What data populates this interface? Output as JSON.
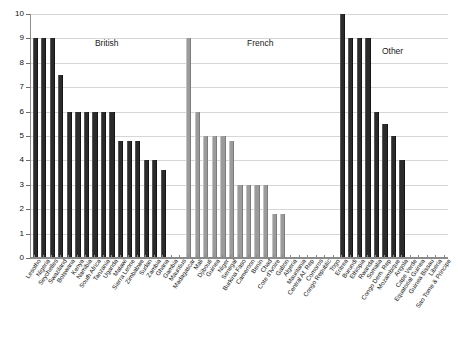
{
  "chart_data": {
    "type": "bar",
    "title": "",
    "subtitle": "",
    "xlabel": "",
    "ylabel": "",
    "ylim": [
      0,
      10
    ],
    "y_ticks": [
      0,
      1,
      2,
      3,
      4,
      5,
      6,
      7,
      8,
      9,
      10
    ],
    "grid": true,
    "legend": "none",
    "group_labels": [
      "British",
      "French",
      "Other"
    ],
    "groups": [
      {
        "name": "British",
        "color": "#2b2b2b",
        "categories": [
          "Lesotho",
          "Nigeria",
          "Seychelles",
          "Swaziland",
          "Botswana",
          "Kenya",
          "Namibia",
          "South Africa",
          "Tanzania",
          "Uganda",
          "Malawi",
          "Sierra Leone",
          "Zimbabwe",
          "Sudan",
          "Zambia",
          "Ghana",
          "Gambia",
          "Mauritius"
        ],
        "values": [
          9,
          9,
          9,
          7.5,
          6,
          6,
          6,
          6,
          6,
          6,
          4.8,
          4.8,
          4.8,
          4,
          4,
          3.6,
          0,
          0
        ]
      },
      {
        "name": "French",
        "color": "#9b9b9b",
        "categories": [
          "Madagascar",
          "Mali",
          "Djibouti",
          "Guinea",
          "Niger",
          "Senegal",
          "Burkina Faso",
          "Cameroon",
          "Benin",
          "Chad",
          "Cote d'Ivoire",
          "Gabon",
          "Algeria",
          "Mauritania",
          "Central Af. Rep",
          "Comoros",
          "Congo Republic",
          "Togo"
        ],
        "values": [
          9,
          6,
          5,
          5,
          5,
          4.8,
          3,
          3,
          3,
          3,
          1.8,
          1.8,
          0,
          0,
          0,
          0,
          0,
          0
        ]
      },
      {
        "name": "Other",
        "color": "#2b2b2b",
        "categories": [
          "Eritrea",
          "Burundi",
          "Ethiopia",
          "Rwanda",
          "Somalia",
          "Congo Dem. Rep",
          "Mozambique",
          "Angola",
          "Cape Verde",
          "Equatorial Guinea",
          "Guinea Bissau",
          "Liberia",
          "Sao Tome & Principe"
        ],
        "values": [
          10,
          9,
          9,
          9,
          6,
          5.5,
          5,
          4,
          0,
          0,
          0,
          0,
          0
        ]
      }
    ]
  }
}
